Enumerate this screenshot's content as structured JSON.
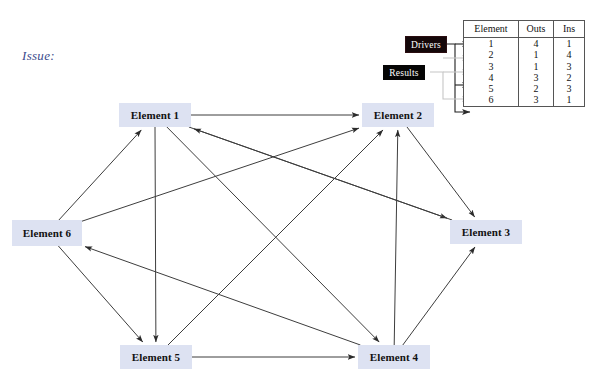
{
  "canvas": {
    "width": 600,
    "height": 388,
    "background": "#ffffff"
  },
  "annotations": {
    "issue_label": "Issue:",
    "issue_color": "#3a4a8c"
  },
  "legend": {
    "drivers_label": "Drivers",
    "results_label": "Results",
    "drivers_color": "#140709",
    "results_color": "#050505",
    "driver_arrow_color": "#1a1a1a",
    "result_arrow_color": "#b8b8b8"
  },
  "nodes": [
    {
      "id": "e1",
      "label": "Element 1",
      "x": 119,
      "y": 103,
      "w": 72,
      "h": 24
    },
    {
      "id": "e2",
      "label": "Element 2",
      "x": 362,
      "y": 103,
      "w": 72,
      "h": 24
    },
    {
      "id": "e3",
      "label": "Element 3",
      "x": 450,
      "y": 220,
      "w": 72,
      "h": 24
    },
    {
      "id": "e4",
      "label": "Element 4",
      "x": 358,
      "y": 345,
      "w": 72,
      "h": 24
    },
    {
      "id": "e5",
      "label": "Element 5",
      "x": 120,
      "y": 345,
      "w": 72,
      "h": 24
    },
    {
      "id": "e6",
      "label": "Element 6",
      "x": 12,
      "y": 220,
      "w": 70,
      "h": 26
    }
  ],
  "node_style": {
    "fill": "#dde2f2",
    "text_color": "#111111"
  },
  "edges": [
    {
      "from": "e1",
      "to": "e2"
    },
    {
      "from": "e1",
      "to": "e3"
    },
    {
      "from": "e1",
      "to": "e4"
    },
    {
      "from": "e1",
      "to": "e5"
    },
    {
      "from": "e2",
      "to": "e3"
    },
    {
      "from": "e3",
      "to": "e1"
    },
    {
      "from": "e4",
      "to": "e2"
    },
    {
      "from": "e4",
      "to": "e3"
    },
    {
      "from": "e4",
      "to": "e6"
    },
    {
      "from": "e5",
      "to": "e2"
    },
    {
      "from": "e5",
      "to": "e4"
    },
    {
      "from": "e6",
      "to": "e1"
    },
    {
      "from": "e6",
      "to": "e2"
    },
    {
      "from": "e6",
      "to": "e5"
    }
  ],
  "edge_style": {
    "stroke": "#3d3d3d",
    "width": 1
  },
  "chart_data": {
    "type": "table",
    "title": "",
    "columns": [
      "Element",
      "Outs",
      "Ins"
    ],
    "rows": [
      {
        "element": "1",
        "outs": "4",
        "ins": "1",
        "kind": "driver"
      },
      {
        "element": "2",
        "outs": "1",
        "ins": "4",
        "kind": "result"
      },
      {
        "element": "3",
        "outs": "1",
        "ins": "3",
        "kind": "result"
      },
      {
        "element": "4",
        "outs": "3",
        "ins": "2",
        "kind": "driver"
      },
      {
        "element": "5",
        "outs": "2",
        "ins": "3",
        "kind": "result"
      },
      {
        "element": "6",
        "outs": "3",
        "ins": "1",
        "kind": "driver"
      }
    ]
  }
}
